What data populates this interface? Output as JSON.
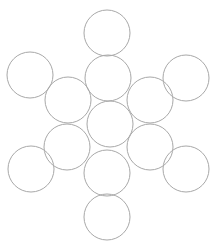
{
  "figure": {
    "name": "circle-packing-diagram",
    "canvas": {
      "width": 215,
      "height": 246,
      "background_color": "#ffffff"
    },
    "style": {
      "stroke_color": "#a8a8a8",
      "stroke_width": 1,
      "fill_color": "none"
    },
    "circle_radius": 23,
    "circle_count": 13,
    "circles": [
      {
        "id": "circle-top",
        "label": "top",
        "cx": 107,
        "cy": 33,
        "r": 23
      },
      {
        "id": "circle-upper-left-outer",
        "label": "upper-left-outer",
        "cx": 30,
        "cy": 75,
        "r": 23
      },
      {
        "id": "circle-upper-middle",
        "label": "upper-middle",
        "cx": 108,
        "cy": 78,
        "r": 23
      },
      {
        "id": "circle-upper-right-outer",
        "label": "upper-right-outer",
        "cx": 186,
        "cy": 78,
        "r": 23
      },
      {
        "id": "circle-inner-upper-left",
        "label": "inner-upper-left",
        "cx": 68,
        "cy": 100,
        "r": 23
      },
      {
        "id": "circle-inner-upper-right",
        "label": "inner-upper-right",
        "cx": 150,
        "cy": 100,
        "r": 23
      },
      {
        "id": "circle-center",
        "label": "center",
        "cx": 110,
        "cy": 124,
        "r": 23
      },
      {
        "id": "circle-inner-lower-left",
        "label": "inner-lower-left",
        "cx": 67,
        "cy": 147,
        "r": 23
      },
      {
        "id": "circle-inner-lower-right",
        "label": "inner-lower-right",
        "cx": 150,
        "cy": 147,
        "r": 23
      },
      {
        "id": "circle-lower-left-outer",
        "label": "lower-left-outer",
        "cx": 31,
        "cy": 169,
        "r": 23
      },
      {
        "id": "circle-lower-middle",
        "label": "lower-middle",
        "cx": 107,
        "cy": 173,
        "r": 23
      },
      {
        "id": "circle-lower-right-outer",
        "label": "lower-right-outer",
        "cx": 186,
        "cy": 169,
        "r": 23
      },
      {
        "id": "circle-bottom",
        "label": "bottom",
        "cx": 107,
        "cy": 217,
        "r": 23
      }
    ]
  }
}
